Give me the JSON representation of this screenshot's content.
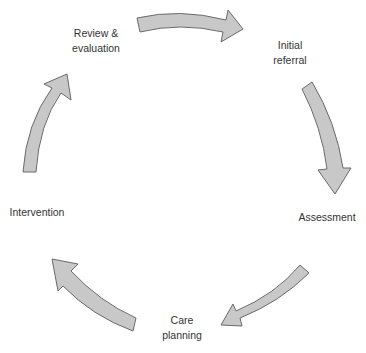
{
  "diagram": {
    "type": "cycle",
    "title": "",
    "colors": {
      "arrow_fill": "#c8c8c8",
      "arrow_stroke": "#6a6a6a",
      "text": "#333333",
      "background": "#ffffff"
    },
    "stages": [
      {
        "id": "initial-referral",
        "line1": "Initial",
        "line2": "referral"
      },
      {
        "id": "assessment",
        "line1": "Assessment",
        "line2": ""
      },
      {
        "id": "care-planning",
        "line1": "Care",
        "line2": "planning"
      },
      {
        "id": "intervention",
        "line1": "Intervention",
        "line2": ""
      },
      {
        "id": "review-evaluation",
        "line1": "Review &",
        "line2": "evaluation"
      }
    ],
    "arrows": [
      {
        "from": "review-evaluation",
        "to": "initial-referral",
        "direction": "clockwise"
      },
      {
        "from": "initial-referral",
        "to": "assessment",
        "direction": "clockwise"
      },
      {
        "from": "assessment",
        "to": "care-planning",
        "direction": "clockwise"
      },
      {
        "from": "care-planning",
        "to": "intervention",
        "direction": "clockwise"
      },
      {
        "from": "intervention",
        "to": "review-evaluation",
        "direction": "clockwise"
      }
    ]
  }
}
